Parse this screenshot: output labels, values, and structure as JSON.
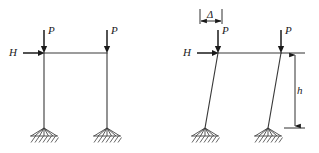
{
  "figure": {
    "background_color": "#ffffff",
    "line_color": "#3a3a3a",
    "load_color": "#1a1a1a",
    "width": 319,
    "height": 153
  },
  "left_frame": {
    "name": "undeformed-portal-frame",
    "loads": {
      "vertical_left": "P",
      "vertical_right": "P",
      "horizontal": "H"
    },
    "geometry": {
      "beam_y": 53,
      "left_column_x": 44,
      "right_column_x": 107,
      "base_y": 128
    },
    "supports": [
      "pinned",
      "pinned"
    ]
  },
  "right_frame": {
    "name": "deformed-portal-frame",
    "loads": {
      "vertical_left": "P",
      "vertical_right": "P",
      "horizontal": "H"
    },
    "dimensions": {
      "sway_label": "Δ",
      "height_label": "h"
    },
    "geometry": {
      "beam_y": 53,
      "left_column_top_x": 218,
      "left_column_base_x": 205,
      "right_column_top_x": 281,
      "right_column_base_x": 268,
      "base_y": 128
    },
    "supports": [
      "pinned",
      "pinned"
    ]
  },
  "labels": {
    "P": "P",
    "H": "H",
    "delta": "Δ",
    "h": "h"
  }
}
